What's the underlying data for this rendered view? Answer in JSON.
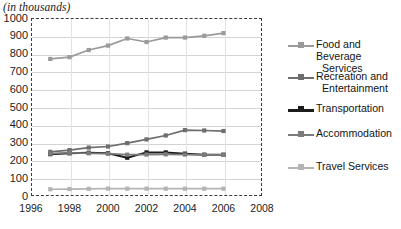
{
  "axis_caption": "(in thousands)",
  "legend": {
    "items": [
      {
        "label_line1": "Food and Beverage",
        "label_line2": "Services",
        "color": "#9a9a9a"
      },
      {
        "label_line1": "Recreation and",
        "label_line2": "Entertainment",
        "color": "#6e6e6e"
      },
      {
        "label_line1": "Transportation",
        "label_line2": "",
        "color": "#1c1c1c"
      },
      {
        "label_line1": "Accommodation",
        "label_line2": "",
        "color": "#7c7c7c"
      },
      {
        "label_line1": "Travel Services",
        "label_line2": "",
        "color": "#b4b4b4"
      }
    ]
  },
  "chart_data": {
    "type": "line",
    "title": "",
    "subtitle": "",
    "xlabel": "",
    "ylabel": "(in thousands)",
    "xlim": [
      1996,
      2008
    ],
    "ylim": [
      0,
      1000
    ],
    "xticks": [
      1996,
      1998,
      2000,
      2002,
      2004,
      2006,
      2008
    ],
    "yticks": [
      0,
      100,
      200,
      300,
      400,
      500,
      600,
      700,
      800,
      900,
      1000
    ],
    "grid": "horizontal",
    "legend_position": "right",
    "marker": "square",
    "x": [
      1997,
      1998,
      1999,
      2000,
      2001,
      2002,
      2003,
      2004,
      2005,
      2006
    ],
    "series": [
      {
        "name": "Food and Beverage Services",
        "color": "#9a9a9a",
        "values": [
          770,
          780,
          820,
          845,
          885,
          865,
          890,
          890,
          900,
          915
        ]
      },
      {
        "name": "Recreation and Entertainment",
        "color": "#6e6e6e",
        "values": [
          248,
          258,
          272,
          278,
          297,
          318,
          340,
          370,
          368,
          365
        ]
      },
      {
        "name": "Transportation",
        "color": "#1c1c1c",
        "values": [
          235,
          240,
          243,
          240,
          215,
          245,
          245,
          238,
          232,
          232
        ]
      },
      {
        "name": "Accommodation",
        "color": "#7c7c7c",
        "values": [
          238,
          243,
          240,
          238,
          232,
          233,
          234,
          233,
          231,
          231
        ]
      },
      {
        "name": "Travel Services",
        "color": "#b4b4b4",
        "values": [
          38,
          39,
          40,
          42,
          41,
          41,
          41,
          41,
          41,
          41
        ]
      }
    ]
  }
}
